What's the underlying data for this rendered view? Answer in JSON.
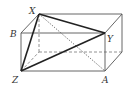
{
  "diagram": {
    "type": "cuboid",
    "colors": {
      "edge": "#555555",
      "thick": "#222222",
      "background": "#ffffff"
    },
    "vertices": {
      "X": {
        "label": "X",
        "x": 39,
        "y": 14
      },
      "back_top_right": {
        "label": "",
        "x": 122,
        "y": 14
      },
      "B": {
        "label": "B",
        "x": 21,
        "y": 33
      },
      "Y": {
        "label": "Y",
        "x": 105,
        "y": 33
      },
      "Z": {
        "label": "Z",
        "x": 21,
        "y": 71
      },
      "A": {
        "label": "A",
        "x": 105,
        "y": 71
      },
      "back_bottom_left": {
        "label": "",
        "x": 39,
        "y": 52
      },
      "back_bottom_right": {
        "label": "",
        "x": 122,
        "y": 52
      }
    },
    "labels": {
      "X": "X",
      "B": "B",
      "Y": "Y",
      "Z": "Z",
      "A": "A"
    },
    "edges": {
      "solid": [
        [
          "B",
          "Y"
        ],
        [
          "Y",
          "A"
        ],
        [
          "A",
          "Z"
        ],
        [
          "Z",
          "B"
        ],
        [
          "B",
          "X"
        ],
        [
          "X",
          "back_top_right"
        ],
        [
          "Y",
          "back_top_right"
        ],
        [
          "back_top_right",
          "back_bottom_right"
        ],
        [
          "A",
          "back_bottom_right"
        ]
      ],
      "dashed": [
        [
          "X",
          "back_bottom_left"
        ],
        [
          "back_bottom_left",
          "back_bottom_right"
        ],
        [
          "Z",
          "back_bottom_left"
        ]
      ],
      "thick": [
        [
          "X",
          "Y"
        ],
        [
          "Y",
          "Z"
        ],
        [
          "Z",
          "X"
        ]
      ],
      "dotted": [
        [
          "X",
          "A"
        ]
      ]
    }
  }
}
